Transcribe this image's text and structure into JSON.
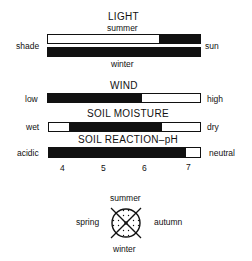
{
  "light": {
    "title": "LIGHT",
    "top_label": "summer",
    "bottom_label": "winter",
    "left_label": "shade",
    "right_label": "sun",
    "summer_bar": {
      "black_from_pct": 73,
      "black_to_pct": 100
    },
    "winter_bar": {
      "black_from_pct": 0,
      "black_to_pct": 100
    }
  },
  "wind": {
    "title": "WIND",
    "left_label": "low",
    "right_label": "high",
    "bar": {
      "black_from_pct": 0,
      "black_to_pct": 62
    }
  },
  "soil_moisture": {
    "title": "SOIL MOISTURE",
    "left_label": "wet",
    "right_label": "dry",
    "bar": {
      "black_from_pct": 13,
      "black_to_pct": 75
    }
  },
  "soil_reaction": {
    "title": "SOIL REACTION–pH",
    "left_label": "acidic",
    "right_label": "neutral",
    "bar": {
      "black_from_pct": 0,
      "black_to_pct": 91
    },
    "ticks": [
      "4",
      "5",
      "6",
      "7"
    ]
  },
  "season": {
    "top": "summer",
    "bottom": "winter",
    "left": "spring",
    "right": "autumn",
    "icon": "season-circle-icon"
  }
}
